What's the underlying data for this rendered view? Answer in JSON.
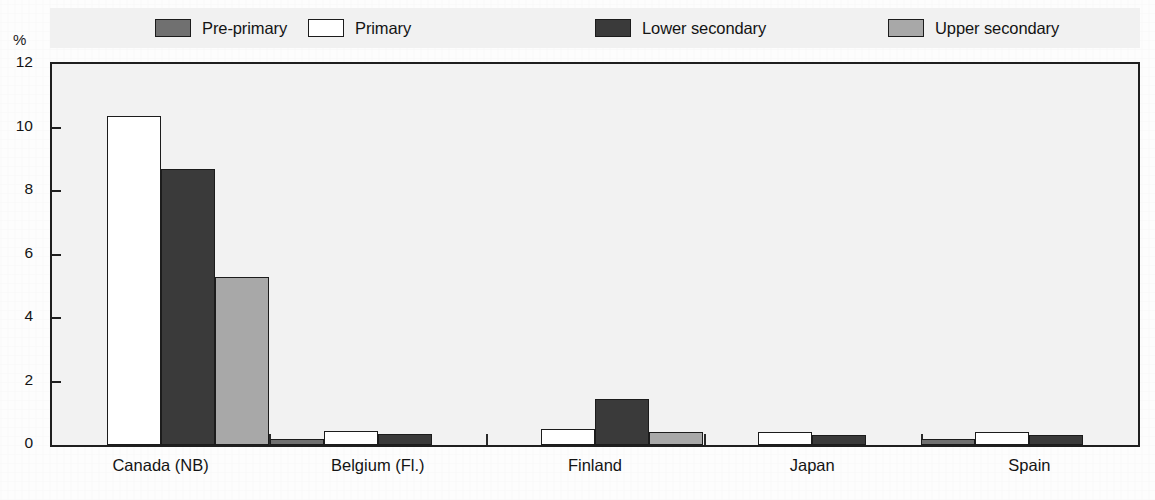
{
  "chart_data": {
    "type": "bar",
    "title": "",
    "xlabel": "",
    "ylabel": "%",
    "ylim": [
      0,
      12
    ],
    "yticks": [
      0,
      2,
      4,
      6,
      8,
      10,
      12
    ],
    "grid": false,
    "legend_position": "top",
    "categories": [
      "Canada (NB)",
      "Belgium (Fl.)",
      "Finland",
      "Japan",
      "Spain"
    ],
    "series": [
      {
        "name": "Pre-primary",
        "color": "#707070",
        "values": [
          0,
          0.2,
          0,
          0,
          0.2
        ]
      },
      {
        "name": "Primary",
        "color": "#ffffff",
        "values": [
          10.35,
          0.45,
          0.5,
          0.4,
          0.4
        ]
      },
      {
        "name": "Lower secondary",
        "color": "#3a3a3a",
        "values": [
          8.7,
          0.35,
          1.45,
          0.3,
          0.3
        ]
      },
      {
        "name": "Upper secondary",
        "color": "#a8a8a8",
        "values": [
          5.3,
          0,
          0.4,
          0,
          0
        ]
      }
    ]
  },
  "axis": {
    "unit": "%"
  },
  "colors": {
    "pre_primary": "#707070",
    "primary": "#ffffff",
    "lower_secondary": "#3a3a3a",
    "upper_secondary": "#a8a8a8",
    "frame": "#1f1f1f",
    "plot_background": "#f2f2f2",
    "legend_background": "#f1f1f1"
  }
}
